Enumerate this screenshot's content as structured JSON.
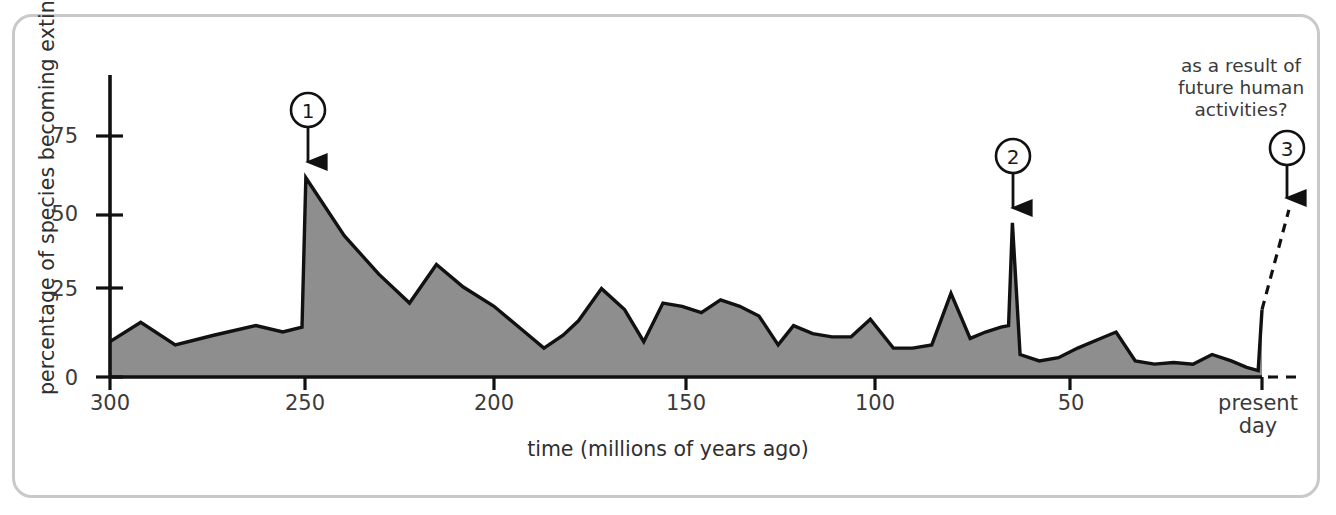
{
  "figure": {
    "border_color": "#c9c9c9",
    "background": "#ffffff"
  },
  "chart_data": {
    "type": "area",
    "title": "",
    "xlabel": "time (millions of years ago)",
    "ylabel": "percentage of species becoming extinct",
    "xlim": [
      300,
      0
    ],
    "ylim": [
      0,
      90
    ],
    "x_ticks": [
      300,
      250,
      200,
      150,
      100,
      50,
      0
    ],
    "x_tick_labels": [
      "300",
      "250",
      "200",
      "150",
      "100",
      "50",
      "present\nday"
    ],
    "y_ticks": [
      0,
      25,
      50,
      75
    ],
    "y_tick_labels": [
      "0",
      "25",
      "50",
      "75"
    ],
    "grid": false,
    "legend": null,
    "series": [
      {
        "name": "percentage of species becoming extinct",
        "fill_color": "#8e8e8e",
        "line_color": "#111111",
        "x": [
          300,
          292,
          283,
          273,
          262,
          255,
          250,
          249,
          239,
          230,
          222,
          215,
          208,
          200,
          193,
          187,
          182,
          178,
          172,
          166,
          161,
          156,
          151,
          146,
          141,
          136,
          131,
          126,
          122,
          117,
          112,
          107,
          102,
          96,
          91,
          86,
          81,
          76,
          72,
          68,
          66,
          65,
          63,
          58,
          53,
          48,
          43,
          38,
          33,
          28,
          23,
          18,
          13,
          8,
          4,
          1,
          0
        ],
        "y": [
          11,
          17,
          10,
          13,
          16,
          14,
          15.5,
          62,
          44,
          32,
          23,
          35,
          28,
          22,
          15,
          9,
          13,
          17.5,
          27.5,
          21,
          11,
          23,
          22,
          20,
          24,
          22,
          19,
          10,
          16,
          13.5,
          12.5,
          12.5,
          18,
          9,
          9,
          10,
          26,
          12,
          14,
          15.5,
          16,
          48,
          7,
          5,
          6,
          9,
          11.5,
          14,
          5,
          4,
          4.5,
          4,
          7,
          5,
          3,
          2,
          21
        ]
      }
    ],
    "projection": {
      "style": "dashed",
      "description": "projected future extinction trend",
      "from": [
        0,
        21
      ],
      "to": [
        -7,
        52
      ]
    },
    "annotations": [
      {
        "id": "1",
        "label": "1",
        "x": 250,
        "y": 62,
        "note": ""
      },
      {
        "id": "2",
        "label": "2",
        "x": 66,
        "y": 48,
        "note": ""
      },
      {
        "id": "3",
        "label": "3",
        "x": -7,
        "y": 52,
        "note": "as a result of\nfuture human\nactivities?"
      }
    ]
  },
  "axis": {
    "y_title": "percentage of species becoming extinct",
    "x_title": "time (millions of years ago)",
    "y_tick_0": "0",
    "y_tick_25": "25",
    "y_tick_50": "50",
    "y_tick_75": "75",
    "x_tick_300": "300",
    "x_tick_250": "250",
    "x_tick_200": "200",
    "x_tick_150": "150",
    "x_tick_100": "100",
    "x_tick_50": "50",
    "x_tick_present_line1": "present",
    "x_tick_present_line2": "day"
  },
  "annotation_text": {
    "future": "as a result of\nfuture human\nactivities?",
    "marker1": "1",
    "marker2": "2",
    "marker3": "3"
  }
}
